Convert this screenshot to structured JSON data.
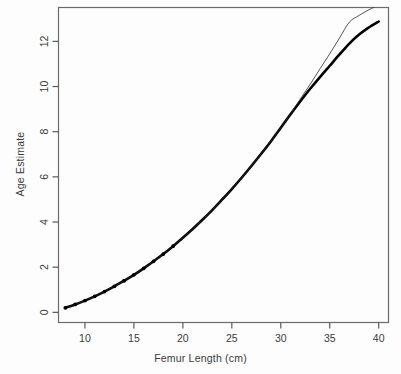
{
  "chart_data": {
    "type": "line",
    "title": "",
    "subtitle": "",
    "xlabel": "Femur Length (cm)",
    "ylabel": "Age Estimate",
    "xlim": [
      7.3,
      41.0
    ],
    "ylim": [
      -0.45,
      13.5
    ],
    "xticks": [
      10,
      15,
      20,
      25,
      30,
      35,
      40
    ],
    "yticks": [
      0,
      2,
      4,
      6,
      8,
      10,
      12
    ],
    "xtick_labels": [
      "10",
      "15",
      "20",
      "25",
      "30",
      "35",
      "40"
    ],
    "ytick_labels": [
      "0",
      "2",
      "4",
      "6",
      "8",
      "10",
      "12"
    ],
    "grid": false,
    "legend": "none",
    "box": true,
    "series": [
      {
        "name": "fitted-curve-thick",
        "style": "solid-thick-with-points",
        "color": "#000000",
        "linewidth": 2.6,
        "marker": "filled-circle",
        "x": [
          8.0,
          9.0,
          10.0,
          11.0,
          12.0,
          13.0,
          14.0,
          15.0,
          16.0,
          17.0,
          18.0,
          19.0,
          20.0,
          21.0,
          22.0,
          23.0,
          24.0,
          25.0,
          26.0,
          27.0,
          28.0,
          29.0,
          30.0,
          31.0,
          32.0,
          33.0,
          34.0,
          35.0,
          36.0,
          37.0,
          38.0,
          39.0,
          40.0
        ],
        "y": [
          0.2,
          0.35,
          0.52,
          0.71,
          0.92,
          1.15,
          1.4,
          1.66,
          1.95,
          2.26,
          2.58,
          2.93,
          3.3,
          3.69,
          4.1,
          4.53,
          4.99,
          5.46,
          5.96,
          6.48,
          7.02,
          7.58,
          8.17,
          8.77,
          9.35,
          9.9,
          10.42,
          10.92,
          11.42,
          11.9,
          12.3,
          12.62,
          12.88
        ]
      },
      {
        "name": "reference-curve-thin",
        "style": "solid-thin",
        "color": "#2a2a2a",
        "linewidth": 0.8,
        "marker": "none",
        "x": [
          8.0,
          10.0,
          12.0,
          14.0,
          16.0,
          18.0,
          20.0,
          22.0,
          24.0,
          26.0,
          28.0,
          30.0,
          31.0,
          32.0,
          33.0,
          34.0,
          35.0,
          36.0,
          37.0,
          38.0,
          39.0,
          40.0
        ],
        "y": [
          0.2,
          0.52,
          0.92,
          1.4,
          1.95,
          2.58,
          3.3,
          4.1,
          4.99,
          5.96,
          7.02,
          8.17,
          8.8,
          9.45,
          10.1,
          10.78,
          11.45,
          12.15,
          12.85,
          13.15,
          13.4,
          13.6
        ]
      }
    ],
    "marker_count": 12,
    "marker_x_range": [
      8,
      19
    ]
  },
  "axes": {
    "x_axis_label": "Femur Length (cm)",
    "y_axis_label": "Age Estimate"
  },
  "colors": {
    "background": "#ffffff",
    "axis": "#5a5a5a",
    "text": "#3a3a3a",
    "curve_thick": "#000000",
    "curve_thin": "#2a2a2a"
  }
}
